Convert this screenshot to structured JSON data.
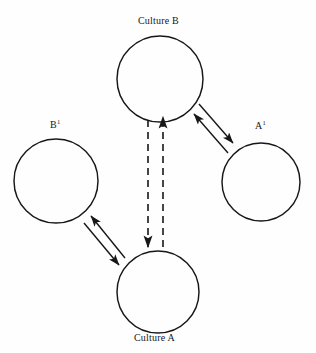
{
  "diagram": {
    "background_color": "#fefefe",
    "stroke_color": "#17171a",
    "nodes": [
      {
        "id": "culture-b",
        "label": "Culture B",
        "label_plain": "Culture B",
        "label_position": "above",
        "cx": 160,
        "cy": 79,
        "r": 43
      },
      {
        "id": "b-prime",
        "label_base": "B",
        "label_sup": "1",
        "label_plain": "B¹",
        "label_position": "above",
        "cx": 56,
        "cy": 181,
        "r": 42
      },
      {
        "id": "a-prime",
        "label_base": "A",
        "label_sup": "1",
        "label_plain": "A¹",
        "label_position": "above",
        "cx": 261,
        "cy": 182,
        "r": 39
      },
      {
        "id": "culture-a",
        "label": "Culture A",
        "label_plain": "Culture A",
        "label_position": "below",
        "cx": 158,
        "cy": 292,
        "r": 41
      }
    ],
    "connections": [
      {
        "id": "culture-b-to-a-prime",
        "from": "culture-b",
        "to": "a-prime",
        "style": "solid",
        "arrows": "both",
        "lines": 2
      },
      {
        "id": "culture-a-to-b-prime",
        "from": "culture-a",
        "to": "b-prime",
        "style": "solid",
        "arrows": "both",
        "lines": 2
      },
      {
        "id": "culture-a-to-culture-b-down",
        "from": "culture-b",
        "to": "culture-a",
        "style": "dashed",
        "arrows": "to",
        "direction": "down"
      },
      {
        "id": "culture-a-to-culture-b-up",
        "from": "culture-a",
        "to": "culture-b",
        "style": "dashed",
        "arrows": "to",
        "direction": "up"
      }
    ]
  }
}
